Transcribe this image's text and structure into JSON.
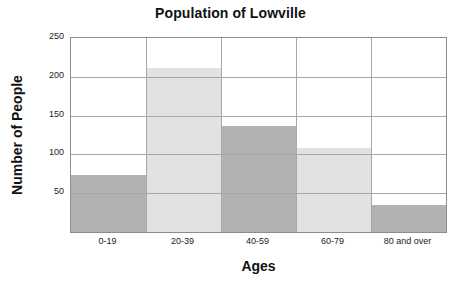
{
  "chart_data": {
    "type": "bar",
    "title": "Population of Lowville",
    "xlabel": "Ages",
    "ylabel": "Number of People",
    "categories": [
      "0-19",
      "20-39",
      "40-59",
      "60-79",
      "80 and over"
    ],
    "values": [
      73,
      211,
      137,
      108,
      35
    ],
    "ylim": [
      0,
      250
    ],
    "yticks": [
      50,
      100,
      150,
      200,
      250
    ],
    "ytick_labels": [
      "50",
      "100",
      "150",
      "200",
      "250"
    ],
    "xlim": [
      0,
      5
    ],
    "grid": "horizontal-and-vertical",
    "legend": "none",
    "bar_colors": [
      "#b2b2b2",
      "#e2e2e2",
      "#b2b2b2",
      "#e2e2e2",
      "#b2b2b2"
    ],
    "grid_color": "#a8a8a8",
    "axis_color": "#8d8d8d",
    "background": "#ffffff",
    "bars": [
      {
        "category": "0-19",
        "value": 73,
        "color": "#b2b2b2"
      },
      {
        "category": "20-39",
        "value": 211,
        "color": "#e2e2e2"
      },
      {
        "category": "40-59",
        "value": 137,
        "color": "#b2b2b2"
      },
      {
        "category": "60-79",
        "value": 108,
        "color": "#e2e2e2"
      },
      {
        "category": "80 and over",
        "value": 35,
        "color": "#b2b2b2"
      }
    ]
  }
}
